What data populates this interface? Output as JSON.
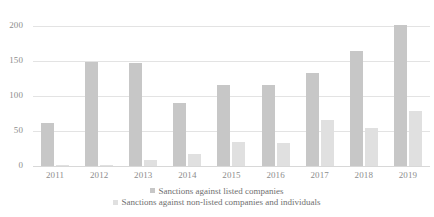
{
  "chart_data": {
    "type": "bar",
    "title": "",
    "subtitle": "",
    "xlabel": "",
    "ylabel": "",
    "categories": [
      "2011",
      "2012",
      "2013",
      "2014",
      "2015",
      "2016",
      "2017",
      "2018",
      "2019"
    ],
    "series": [
      {
        "name": "Sanctions against listed companies",
        "color": "#c7c7c7",
        "values": [
          62,
          149,
          147,
          90,
          116,
          116,
          133,
          165,
          202
        ]
      },
      {
        "name": "Sanctions against non-listed companies and individuals",
        "color": "#e0e0e0",
        "values": [
          1,
          2,
          9,
          17,
          35,
          33,
          66,
          55,
          78
        ]
      }
    ],
    "ylim": [
      0,
      250
    ],
    "yticks": [
      0,
      50,
      100,
      150,
      200,
      250
    ],
    "ytick_labels": [
      "0",
      "50",
      "100",
      "150",
      "200",
      "250"
    ],
    "grid": true,
    "legend_position": "bottom"
  },
  "legend": {
    "items": [
      {
        "label": "Sanctions against listed companies"
      },
      {
        "label": "Sanctions against non-listed companies and individuals"
      }
    ]
  },
  "axis": {
    "y_labels": [
      "250",
      "200",
      "150",
      "100",
      "50",
      "0"
    ],
    "x_labels": [
      "2011",
      "2012",
      "2013",
      "2014",
      "2015",
      "2016",
      "2017",
      "2018",
      "2019"
    ]
  }
}
